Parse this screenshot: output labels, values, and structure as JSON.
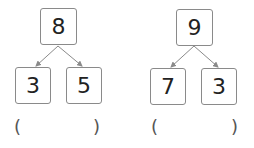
{
  "trees": [
    {
      "top": "8",
      "left": "3",
      "right": "5",
      "answer_open": "(",
      "answer_close": ")",
      "answer_value": ""
    },
    {
      "top": "9",
      "left": "7",
      "right": "3",
      "answer_open": "(",
      "answer_close": ")",
      "answer_value": ""
    }
  ],
  "colors": {
    "box_border": "#8a8a8a",
    "arrow": "#8a8a8a",
    "text": "#222222"
  }
}
